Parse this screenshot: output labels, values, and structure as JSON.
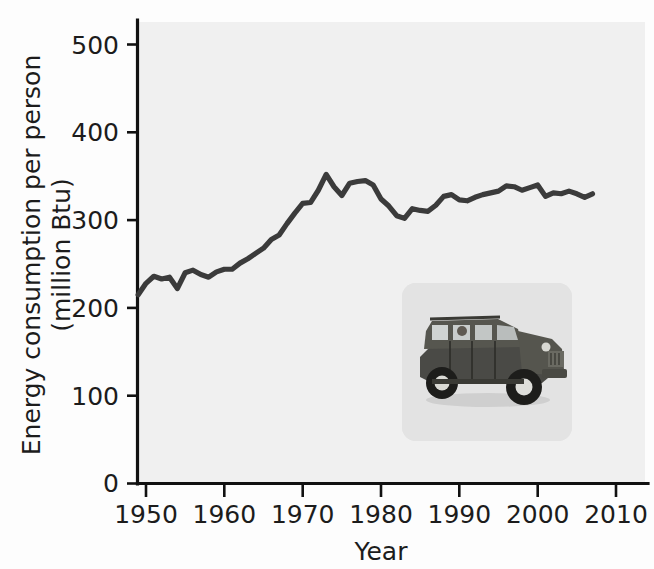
{
  "figure": {
    "background_color": "#fdfdfd",
    "plot_background_color": "#f0f0f0",
    "line_color": "#3b3b3b",
    "axis_color": "#111111",
    "inset_background_color": "#e3e3e3"
  },
  "axes": {
    "xlabel": "Year",
    "ylabel_line1": "Energy consumption per person",
    "ylabel_line2": "(million Btu)",
    "x_ticks": [
      "1950",
      "1960",
      "1970",
      "1980",
      "1990",
      "2000",
      "2010"
    ],
    "y_ticks": [
      "0",
      "100",
      "200",
      "300",
      "400",
      "500"
    ]
  },
  "inset": {
    "name": "hummer-photo",
    "description": "Photograph of a Hummer H1 sport utility vehicle"
  },
  "chart_data": {
    "type": "line",
    "title": "",
    "xlabel": "Year",
    "ylabel": "Energy consumption per person (million Btu)",
    "xlim": [
      1949,
      2013
    ],
    "ylim": [
      0,
      520
    ],
    "xticks": [
      1950,
      1960,
      1970,
      1980,
      1990,
      2000,
      2010
    ],
    "yticks": [
      0,
      100,
      200,
      300,
      400,
      500
    ],
    "grid": false,
    "legend": null,
    "series": [
      {
        "name": "Energy consumption per person (million Btu)",
        "x": [
          1949,
          1950,
          1951,
          1952,
          1953,
          1954,
          1955,
          1956,
          1957,
          1958,
          1959,
          1960,
          1961,
          1962,
          1963,
          1964,
          1965,
          1966,
          1967,
          1968,
          1969,
          1970,
          1971,
          1972,
          1973,
          1974,
          1975,
          1976,
          1977,
          1978,
          1979,
          1980,
          1981,
          1982,
          1983,
          1984,
          1985,
          1986,
          1987,
          1988,
          1989,
          1990,
          1991,
          1992,
          1993,
          1994,
          1995,
          1996,
          1997,
          1998,
          1999,
          2000,
          2001,
          2002,
          2003,
          2004,
          2005,
          2006,
          2007
        ],
        "y": [
          215,
          228,
          236,
          233,
          235,
          222,
          240,
          243,
          238,
          235,
          241,
          244,
          244,
          251,
          256,
          262,
          268,
          278,
          283,
          296,
          308,
          319,
          320,
          334,
          352,
          338,
          328,
          342,
          344,
          345,
          340,
          324,
          316,
          305,
          302,
          313,
          311,
          310,
          317,
          327,
          329,
          323,
          322,
          326,
          329,
          331,
          333,
          339,
          338,
          334,
          337,
          340,
          327,
          331,
          330,
          333,
          330,
          326,
          330
        ]
      }
    ]
  }
}
